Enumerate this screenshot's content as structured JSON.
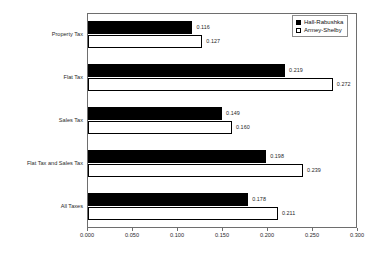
{
  "chart_data": {
    "type": "bar",
    "orientation": "horizontal",
    "title": "",
    "xlabel": "",
    "ylabel": "",
    "xlim": [
      0.0,
      0.3
    ],
    "grid": false,
    "legend_position": "top-right",
    "categories": [
      "Property  Tax",
      "Flat Tax",
      "Sales Tax",
      "Flat Tax and Sales Tax",
      "All Taxes"
    ],
    "xticks": [
      "0.000",
      "0.050",
      "0.100",
      "0.150",
      "0.200",
      "0.250",
      "0.300"
    ],
    "xtick_values": [
      0.0,
      0.05,
      0.1,
      0.15,
      0.2,
      0.25,
      0.3
    ],
    "series": [
      {
        "name": "Hall-Rabushka",
        "fill": "solid",
        "color": "#000000",
        "values": [
          0.116,
          0.219,
          0.149,
          0.198,
          0.178
        ],
        "labels": [
          "0.116",
          "0.219",
          "0.149",
          "0.198",
          "0.178"
        ]
      },
      {
        "name": "Armey-Shelby",
        "fill": "hollow",
        "color": "#ffffff",
        "values": [
          0.127,
          0.272,
          0.16,
          0.239,
          0.211
        ],
        "labels": [
          "0.127",
          "0.272",
          "0.160",
          "0.239",
          "0.211"
        ]
      }
    ]
  },
  "legend": {
    "items": [
      {
        "label": "Hall-Rabushka",
        "swatch": "legend-swatch-solid"
      },
      {
        "label": "Armey-Shelby",
        "swatch": "legend-swatch-hollow"
      }
    ]
  }
}
